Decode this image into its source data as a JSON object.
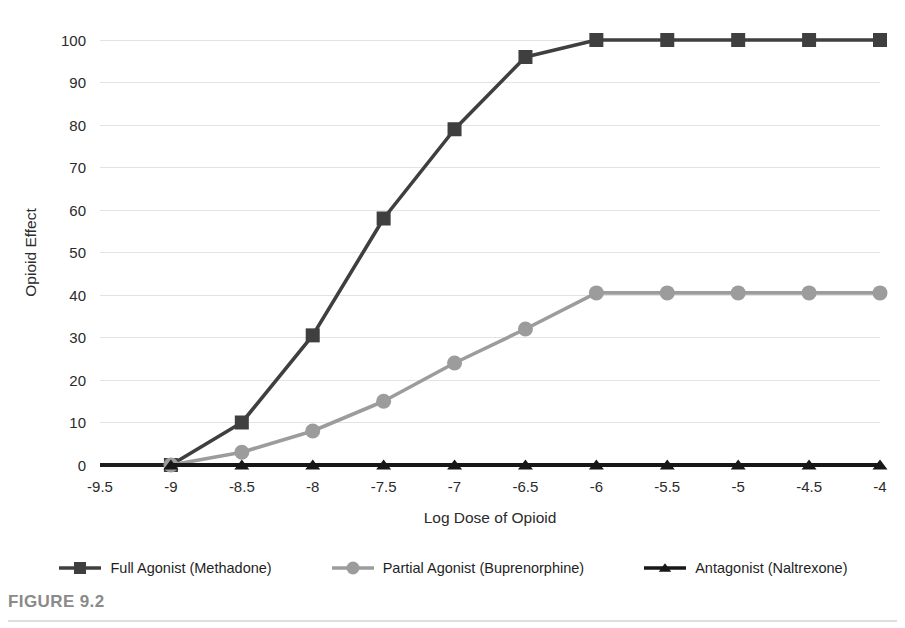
{
  "figure": {
    "caption": "FIGURE 9.2"
  },
  "chart_data": {
    "type": "line",
    "title": "",
    "xlabel": "Log Dose of Opioid",
    "ylabel": "Opioid Effect",
    "x": [
      -9.5,
      -9,
      -8.5,
      -8,
      -7.5,
      -7,
      -6.5,
      -6,
      -5.5,
      -5,
      -4.5,
      -4
    ],
    "xtick_labels": [
      "-9.5",
      "-9",
      "-8.5",
      "-8",
      "-7.5",
      "-7",
      "-6.5",
      "-6",
      "-5.5",
      "-5",
      "-4.5",
      "-4"
    ],
    "xlim": [
      -9.5,
      -4
    ],
    "ylim": [
      0,
      100
    ],
    "ytick_labels": [
      "0",
      "10",
      "20",
      "30",
      "40",
      "50",
      "60",
      "70",
      "80",
      "90",
      "100"
    ],
    "yticks": [
      0,
      10,
      20,
      30,
      40,
      50,
      60,
      70,
      80,
      90,
      100
    ],
    "grid": true,
    "legend_position": "bottom",
    "series": [
      {
        "name": "Full Agonist (Methadone)",
        "marker": "square",
        "color": "#3f3f3f",
        "x": [
          -9,
          -8.5,
          -8,
          -7.5,
          -7,
          -6.5,
          -6,
          -5.5,
          -5,
          -4.5,
          -4
        ],
        "values": [
          0,
          10,
          30.5,
          58,
          79,
          96,
          100,
          100,
          100,
          100,
          100
        ]
      },
      {
        "name": "Partial Agonist (Buprenorphine)",
        "marker": "circle",
        "color": "#9c9c9c",
        "x": [
          -9,
          -8.5,
          -8,
          -7.5,
          -7,
          -6.5,
          -6,
          -5.5,
          -5,
          -4.5,
          -4
        ],
        "values": [
          0,
          3,
          8,
          15,
          24,
          32,
          40.5,
          40.5,
          40.5,
          40.5,
          40.5
        ]
      },
      {
        "name": "Antagonist (Naltrexone)",
        "marker": "triangle",
        "color": "#171717",
        "x": [
          -9,
          -8.5,
          -8,
          -7.5,
          -7,
          -6.5,
          -6,
          -5.5,
          -5,
          -4.5,
          -4
        ],
        "values": [
          0,
          0,
          0,
          0,
          0,
          0,
          0,
          0,
          0,
          0,
          0
        ]
      }
    ]
  }
}
